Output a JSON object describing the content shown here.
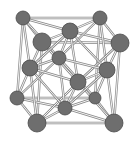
{
  "diagram": {
    "type": "crystal-lattice-unit-cell",
    "structure": "face-centered cubic",
    "colors": {
      "background": "#ffffff",
      "atom_fill": "#6e6e6e",
      "atom_stroke": "#4a4a4a",
      "bond_outline": "#8a8a8a",
      "bond_core": "#f4f4f4"
    },
    "atoms": [
      {
        "id": "c-back-top-left",
        "x": 23,
        "y": 18,
        "r": 7
      },
      {
        "id": "c-back-top-right",
        "x": 100,
        "y": 18,
        "r": 7
      },
      {
        "id": "c-back-bottom-left",
        "x": 17,
        "y": 98,
        "r": 7
      },
      {
        "id": "c-back-bottom-right",
        "x": 95,
        "y": 98,
        "r": 6
      },
      {
        "id": "f-back",
        "x": 59,
        "y": 58,
        "r": 7
      },
      {
        "id": "f-top",
        "x": 70,
        "y": 31,
        "r": 8
      },
      {
        "id": "f-bottom",
        "x": 65,
        "y": 108,
        "r": 7
      },
      {
        "id": "f-left",
        "x": 30,
        "y": 68,
        "r": 8
      },
      {
        "id": "f-right",
        "x": 107,
        "y": 70,
        "r": 8
      },
      {
        "id": "f-front",
        "x": 78,
        "y": 82,
        "r": 8
      },
      {
        "id": "c-front-top-left",
        "x": 42,
        "y": 42,
        "r": 9
      },
      {
        "id": "c-front-top-right",
        "x": 120,
        "y": 43,
        "r": 9
      },
      {
        "id": "c-front-bottom-left",
        "x": 37,
        "y": 123,
        "r": 9
      },
      {
        "id": "c-front-bottom-right",
        "x": 114,
        "y": 123,
        "r": 9
      }
    ],
    "bonds": [
      [
        "c-back-top-left",
        "c-back-top-right"
      ],
      [
        "c-back-top-left",
        "c-front-top-left"
      ],
      [
        "c-back-top-right",
        "c-front-top-right"
      ],
      [
        "c-front-top-left",
        "c-front-top-right"
      ],
      [
        "c-back-bottom-left",
        "c-back-bottom-right"
      ],
      [
        "c-back-bottom-left",
        "c-front-bottom-left"
      ],
      [
        "c-back-bottom-right",
        "c-front-bottom-right"
      ],
      [
        "c-front-bottom-left",
        "c-front-bottom-right"
      ],
      [
        "c-back-top-left",
        "c-back-bottom-left"
      ],
      [
        "c-back-top-right",
        "c-back-bottom-right"
      ],
      [
        "c-front-top-left",
        "c-front-bottom-left"
      ],
      [
        "c-front-top-right",
        "c-front-bottom-right"
      ],
      [
        "f-top",
        "c-back-top-left"
      ],
      [
        "f-top",
        "c-back-top-right"
      ],
      [
        "f-top",
        "c-front-top-left"
      ],
      [
        "f-top",
        "c-front-top-right"
      ],
      [
        "f-bottom",
        "c-back-bottom-left"
      ],
      [
        "f-bottom",
        "c-back-bottom-right"
      ],
      [
        "f-bottom",
        "c-front-bottom-left"
      ],
      [
        "f-bottom",
        "c-front-bottom-right"
      ],
      [
        "f-left",
        "c-back-top-left"
      ],
      [
        "f-left",
        "c-back-bottom-left"
      ],
      [
        "f-left",
        "c-front-top-left"
      ],
      [
        "f-left",
        "c-front-bottom-left"
      ],
      [
        "f-right",
        "c-back-top-right"
      ],
      [
        "f-right",
        "c-back-bottom-right"
      ],
      [
        "f-right",
        "c-front-top-right"
      ],
      [
        "f-right",
        "c-front-bottom-right"
      ],
      [
        "f-back",
        "c-back-top-left"
      ],
      [
        "f-back",
        "c-back-top-right"
      ],
      [
        "f-back",
        "c-back-bottom-left"
      ],
      [
        "f-back",
        "c-back-bottom-right"
      ],
      [
        "f-front",
        "c-front-top-left"
      ],
      [
        "f-front",
        "c-front-top-right"
      ],
      [
        "f-front",
        "c-front-bottom-left"
      ],
      [
        "f-front",
        "c-front-bottom-right"
      ],
      [
        "f-top",
        "f-left"
      ],
      [
        "f-top",
        "f-right"
      ],
      [
        "f-top",
        "f-back"
      ],
      [
        "f-top",
        "f-front"
      ],
      [
        "f-bottom",
        "f-left"
      ],
      [
        "f-bottom",
        "f-right"
      ],
      [
        "f-bottom",
        "f-back"
      ],
      [
        "f-bottom",
        "f-front"
      ],
      [
        "f-left",
        "f-back"
      ],
      [
        "f-left",
        "f-front"
      ],
      [
        "f-right",
        "f-back"
      ],
      [
        "f-right",
        "f-front"
      ]
    ]
  }
}
